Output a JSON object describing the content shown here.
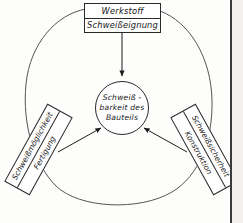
{
  "diagram": {
    "title_center": {
      "lines": [
        "Schweiß -",
        "barkeit des",
        "Bauteils"
      ]
    },
    "nodes": {
      "werkstoff": {
        "line1": "Werkstoff",
        "line2": "Schweißeignung"
      },
      "fertigung": {
        "line1": "Schweißmöglichkeit",
        "line2": "Fertigung"
      },
      "konstruktion": {
        "line1": "Schweißsicherheit",
        "line2": "Konstruktion"
      }
    },
    "colors": {
      "ink": "#2a2a2a",
      "text": "#161616",
      "background": "#fdfdfc",
      "page_edge": "#3a3a3a",
      "page_margin": "#f2f1ef"
    },
    "connectors": [
      {
        "from": "werkstoff",
        "to": "center",
        "direction": "down"
      },
      {
        "from": "fertigung",
        "to": "center",
        "direction": "up-right"
      },
      {
        "from": "konstruktion",
        "to": "center",
        "direction": "up-left"
      }
    ]
  }
}
